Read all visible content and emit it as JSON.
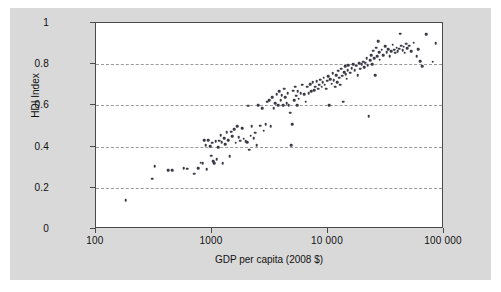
{
  "chart_data": {
    "type": "scatter",
    "title": "",
    "xlabel": "GDP per capita (2008 $)",
    "ylabel": "HDI Index",
    "xscale": "log",
    "yscale": "linear",
    "xlim": [
      100,
      100000
    ],
    "ylim": [
      0,
      1
    ],
    "grid": "horizontal-dashed",
    "legend": "none",
    "x_ticks": [
      {
        "value": 100,
        "label": "100"
      },
      {
        "value": 1000,
        "label": "1000"
      },
      {
        "value": 10000,
        "label": "10 000"
      },
      {
        "value": 100000,
        "label": "100 000"
      }
    ],
    "y_ticks": [
      {
        "value": 0,
        "label": "0"
      },
      {
        "value": 0.2,
        "label": "0.2"
      },
      {
        "value": 0.4,
        "label": "0.4"
      },
      {
        "value": 0.6,
        "label": "0.6"
      },
      {
        "value": 0.8,
        "label": "0.8"
      },
      {
        "value": 1,
        "label": "1"
      }
    ],
    "gridlines_y": [
      0.2,
      0.4,
      0.6,
      0.8
    ],
    "marker_color": "#3a3a46",
    "axis_color": "#4a4a4a",
    "grid_color": "#9a9a9a",
    "plot_background": "#ffffff",
    "page_background": "#d9d9d9",
    "point_count": 177,
    "series": [
      {
        "name": "Countries",
        "points": [
          [
            180,
            0.14
          ],
          [
            305,
            0.245
          ],
          [
            320,
            0.305
          ],
          [
            420,
            0.285
          ],
          [
            455,
            0.285
          ],
          [
            570,
            0.295
          ],
          [
            610,
            0.292
          ],
          [
            700,
            0.268
          ],
          [
            760,
            0.295
          ],
          [
            800,
            0.322
          ],
          [
            830,
            0.32
          ],
          [
            860,
            0.43
          ],
          [
            880,
            0.408
          ],
          [
            900,
            0.29
          ],
          [
            930,
            0.432
          ],
          [
            960,
            0.402
          ],
          [
            980,
            0.355
          ],
          [
            1000,
            0.418
          ],
          [
            1020,
            0.33
          ],
          [
            1050,
            0.318
          ],
          [
            1080,
            0.425
          ],
          [
            1100,
            0.34
          ],
          [
            1130,
            0.398
          ],
          [
            1160,
            0.428
          ],
          [
            1190,
            0.455
          ],
          [
            1210,
            0.42
          ],
          [
            1240,
            0.318
          ],
          [
            1270,
            0.44
          ],
          [
            1300,
            0.412
          ],
          [
            1340,
            0.47
          ],
          [
            1380,
            0.432
          ],
          [
            1420,
            0.352
          ],
          [
            1460,
            0.472
          ],
          [
            1500,
            0.45
          ],
          [
            1560,
            0.485
          ],
          [
            1600,
            0.418
          ],
          [
            1650,
            0.5
          ],
          [
            1700,
            0.445
          ],
          [
            1760,
            0.428
          ],
          [
            1820,
            0.49
          ],
          [
            1880,
            0.438
          ],
          [
            1950,
            0.425
          ],
          [
            2000,
            0.42
          ],
          [
            2050,
            0.598
          ],
          [
            2100,
            0.385
          ],
          [
            2150,
            0.452
          ],
          [
            2200,
            0.5
          ],
          [
            2280,
            0.44
          ],
          [
            2350,
            0.468
          ],
          [
            2420,
            0.408
          ],
          [
            2500,
            0.6
          ],
          [
            2600,
            0.502
          ],
          [
            2700,
            0.585
          ],
          [
            2800,
            0.478
          ],
          [
            2900,
            0.51
          ],
          [
            3000,
            0.618
          ],
          [
            3100,
            0.625
          ],
          [
            3200,
            0.5
          ],
          [
            3300,
            0.64
          ],
          [
            3400,
            0.585
          ],
          [
            3500,
            0.61
          ],
          [
            3600,
            0.655
          ],
          [
            3700,
            0.602
          ],
          [
            3800,
            0.668
          ],
          [
            3900,
            0.625
          ],
          [
            4000,
            0.65
          ],
          [
            4100,
            0.6
          ],
          [
            4200,
            0.682
          ],
          [
            4300,
            0.64
          ],
          [
            4400,
            0.612
          ],
          [
            4500,
            0.658
          ],
          [
            4600,
            0.6
          ],
          [
            4700,
            0.565
          ],
          [
            4800,
            0.408
          ],
          [
            4900,
            0.51
          ],
          [
            5000,
            0.672
          ],
          [
            5100,
            0.625
          ],
          [
            5200,
            0.69
          ],
          [
            5300,
            0.648
          ],
          [
            5400,
            0.6
          ],
          [
            5500,
            0.67
          ],
          [
            5600,
            0.632
          ],
          [
            5800,
            0.66
          ],
          [
            6000,
            0.7
          ],
          [
            6200,
            0.655
          ],
          [
            6400,
            0.618
          ],
          [
            6600,
            0.69
          ],
          [
            6800,
            0.658
          ],
          [
            7000,
            0.702
          ],
          [
            7200,
            0.668
          ],
          [
            7400,
            0.712
          ],
          [
            7600,
            0.675
          ],
          [
            7800,
            0.69
          ],
          [
            8000,
            0.718
          ],
          [
            8200,
            0.682
          ],
          [
            8400,
            0.7
          ],
          [
            8600,
            0.725
          ],
          [
            8800,
            0.69
          ],
          [
            9000,
            0.712
          ],
          [
            9200,
            0.735
          ],
          [
            9400,
            0.7
          ],
          [
            9600,
            0.682
          ],
          [
            9800,
            0.72
          ],
          [
            10000,
            0.742
          ],
          [
            10200,
            0.6
          ],
          [
            10500,
            0.728
          ],
          [
            10800,
            0.705
          ],
          [
            11000,
            0.755
          ],
          [
            11200,
            0.722
          ],
          [
            11500,
            0.69
          ],
          [
            11800,
            0.748
          ],
          [
            12000,
            0.712
          ],
          [
            12200,
            0.768
          ],
          [
            12500,
            0.735
          ],
          [
            12800,
            0.7
          ],
          [
            13000,
            0.778
          ],
          [
            13200,
            0.745
          ],
          [
            13500,
            0.618
          ],
          [
            13800,
            0.76
          ],
          [
            14000,
            0.79
          ],
          [
            14200,
            0.752
          ],
          [
            14500,
            0.73
          ],
          [
            14800,
            0.772
          ],
          [
            15000,
            0.795
          ],
          [
            15500,
            0.758
          ],
          [
            16000,
            0.782
          ],
          [
            16500,
            0.8
          ],
          [
            17000,
            0.77
          ],
          [
            17500,
            0.792
          ],
          [
            18000,
            0.748
          ],
          [
            18500,
            0.805
          ],
          [
            19000,
            0.778
          ],
          [
            19500,
            0.8
          ],
          [
            20000,
            0.812
          ],
          [
            20500,
            0.785
          ],
          [
            21000,
            0.808
          ],
          [
            21500,
            0.83
          ],
          [
            22000,
            0.795
          ],
          [
            22500,
            0.548
          ],
          [
            23000,
            0.82
          ],
          [
            23500,
            0.845
          ],
          [
            24000,
            0.8
          ],
          [
            24500,
            0.865
          ],
          [
            25000,
            0.828
          ],
          [
            25500,
            0.748
          ],
          [
            26000,
            0.88
          ],
          [
            26500,
            0.838
          ],
          [
            27000,
            0.912
          ],
          [
            27500,
            0.858
          ],
          [
            28000,
            0.822
          ],
          [
            29000,
            0.87
          ],
          [
            30000,
            0.845
          ],
          [
            31000,
            0.888
          ],
          [
            32000,
            0.858
          ],
          [
            33000,
            0.872
          ],
          [
            34000,
            0.84
          ],
          [
            35000,
            0.862
          ],
          [
            36000,
            0.895
          ],
          [
            37000,
            0.87
          ],
          [
            38000,
            0.855
          ],
          [
            39000,
            0.88
          ],
          [
            40000,
            0.862
          ],
          [
            41000,
            0.875
          ],
          [
            42000,
            0.948
          ],
          [
            43000,
            0.89
          ],
          [
            44000,
            0.868
          ],
          [
            45000,
            0.885
          ],
          [
            46000,
            0.855
          ],
          [
            47000,
            0.9
          ],
          [
            48000,
            0.878
          ],
          [
            50000,
            0.89
          ],
          [
            52000,
            0.862
          ],
          [
            55000,
            0.905
          ],
          [
            58000,
            0.84
          ],
          [
            60000,
            0.872
          ],
          [
            62000,
            0.815
          ],
          [
            65000,
            0.79
          ],
          [
            70000,
            0.945
          ],
          [
            80000,
            0.812
          ],
          [
            85000,
            0.902
          ]
        ]
      }
    ]
  }
}
